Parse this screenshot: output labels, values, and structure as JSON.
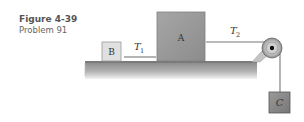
{
  "caption": {
    "figure": "Figure 4-39",
    "problem": "Problem 91"
  },
  "diagram": {
    "blocks": [
      {
        "id": "B",
        "label": "B",
        "color": "#e0e0e0"
      },
      {
        "id": "A",
        "label": "A",
        "color": "#999999"
      },
      {
        "id": "C",
        "label": "C",
        "color": "#8a8a8a"
      }
    ],
    "tensions": [
      {
        "id": "T1",
        "symbol": "T",
        "subscript": "1"
      },
      {
        "id": "T2",
        "symbol": "T",
        "subscript": "2"
      }
    ],
    "table_color": "#a9a9a9",
    "pulley": "pulley"
  }
}
